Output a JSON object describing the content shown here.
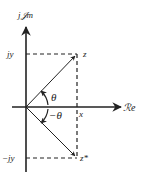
{
  "diagram": {
    "axes": {
      "imaginary_label": "j𝒥m",
      "real_label": "ℛe"
    },
    "labels": {
      "jy": "jy",
      "neg_jy": "−jy",
      "x": "x",
      "z": "z",
      "z_conj": "z*",
      "theta": "θ",
      "neg_theta": "−θ"
    },
    "colors": {
      "stroke": "#222222",
      "background": "#ffffff"
    }
  }
}
